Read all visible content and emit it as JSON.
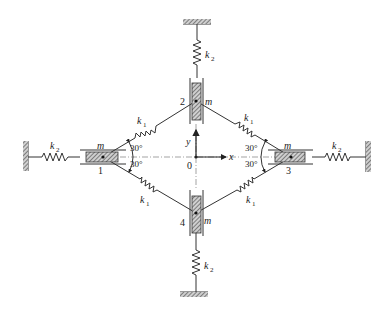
{
  "diagram": {
    "title": "",
    "type": "mechanical-spring-mass-system",
    "masses": [
      {
        "id": "1",
        "label": "1",
        "mass_label": "m"
      },
      {
        "id": "2",
        "label": "2",
        "mass_label": "m"
      },
      {
        "id": "3",
        "label": "3",
        "mass_label": "m"
      },
      {
        "id": "4",
        "label": "4",
        "mass_label": "m"
      }
    ],
    "springs": {
      "diagonal_label": "k",
      "diagonal_sub": "1",
      "ground_label": "k",
      "ground_sub": "2"
    },
    "angles": {
      "a1": "30°",
      "a2": "30°",
      "a3": "30°",
      "a4": "30°"
    },
    "axes": {
      "x_label": "x",
      "y_label": "y",
      "origin_label": "0"
    },
    "colors": {
      "line": "#333333",
      "hatch": "#555555",
      "background": "#ffffff"
    }
  }
}
